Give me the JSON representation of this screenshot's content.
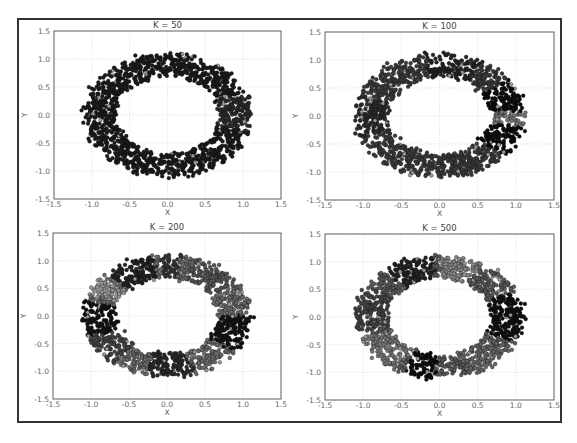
{
  "chart_data": [
    {
      "type": "scatter",
      "title": "K = 50",
      "xlabel": "X",
      "ylabel": "Y",
      "xlim": [
        -1.5,
        1.5
      ],
      "ylim": [
        -1.5,
        1.5
      ],
      "xticks": [
        "-1.5",
        "-1.0",
        "-0.5",
        "0.0",
        "0.5",
        "1.0",
        "1.5"
      ],
      "yticks": [
        "1.5",
        "1.0",
        "0.5",
        "0.0",
        "-0.5",
        "-1.0",
        "-1.5"
      ],
      "grid": true,
      "data_description": "Noisy ring of points (radius ~0.7 to ~1.1) colored by cluster; nearly all dark",
      "ring": {
        "inner_radius": 0.7,
        "outer_radius": 1.1,
        "n_points": 1400
      },
      "clusters": [
        {
          "from_deg": 0,
          "to_deg": 360,
          "gray": "#1a1a1a"
        },
        {
          "from_deg": -15,
          "to_deg": 20,
          "gray": "#2a2a2a",
          "speckle": "#888888"
        }
      ]
    },
    {
      "type": "scatter",
      "title": "K = 100",
      "xlabel": "X",
      "ylabel": "Y",
      "xlim": [
        -1.5,
        1.5
      ],
      "ylim": [
        -1.5,
        1.5
      ],
      "xticks": [
        "-1.5",
        "-1.0",
        "-0.5",
        "0.0",
        "0.5",
        "1.0",
        "1.5"
      ],
      "yticks": [
        "1.5",
        "1.0",
        "0.5",
        "0.0",
        "-0.5",
        "-1.0",
        "-1.5"
      ],
      "grid": true,
      "data_description": "Noisy ring, mostly dark gray with a black cluster on the right side",
      "ring": {
        "inner_radius": 0.7,
        "outer_radius": 1.1,
        "n_points": 1400
      },
      "clusters": [
        {
          "from_deg": 0,
          "to_deg": 360,
          "gray": "#3a3a3a"
        },
        {
          "from_deg": -40,
          "to_deg": 35,
          "gray": "#0a0a0a"
        },
        {
          "from_deg": -10,
          "to_deg": 5,
          "gray": "#777777"
        },
        {
          "from_deg": 60,
          "to_deg": 100,
          "gray": "#222222"
        },
        {
          "from_deg": 160,
          "to_deg": 200,
          "gray": "#2a2a2a"
        }
      ]
    },
    {
      "type": "scatter",
      "title": "K = 200",
      "xlabel": "X",
      "ylabel": "Y",
      "xlim": [
        -1.5,
        1.5
      ],
      "ylim": [
        -1.5,
        1.5
      ],
      "xticks": [
        "-1.5",
        "-1.0",
        "-0.5",
        "0.0",
        "0.5",
        "1.0",
        "1.5"
      ],
      "yticks": [
        "1.5",
        "1.0",
        "0.5",
        "0.0",
        "-0.5",
        "-1.0",
        "-1.5"
      ],
      "grid": true,
      "data_description": "Noisy ring with mixed gray clusters; dark clusters at left, top-left, top-center, right and bottom-center",
      "ring": {
        "inner_radius": 0.7,
        "outer_radius": 1.1,
        "n_points": 1400
      },
      "clusters": [
        {
          "from_deg": 0,
          "to_deg": 360,
          "gray": "#6a6a6a"
        },
        {
          "from_deg": 100,
          "to_deg": 135,
          "gray": "#222222"
        },
        {
          "from_deg": 80,
          "to_deg": 95,
          "gray": "#333333"
        },
        {
          "from_deg": 165,
          "to_deg": 200,
          "gray": "#111111"
        },
        {
          "from_deg": 200,
          "to_deg": 230,
          "gray": "#444444"
        },
        {
          "from_deg": -35,
          "to_deg": -5,
          "gray": "#111111"
        },
        {
          "from_deg": 255,
          "to_deg": 290,
          "gray": "#2a2a2a"
        },
        {
          "from_deg": 140,
          "to_deg": 160,
          "gray": "#999999"
        },
        {
          "from_deg": 30,
          "to_deg": 70,
          "gray": "#555555"
        }
      ]
    },
    {
      "type": "scatter",
      "title": "K = 500",
      "xlabel": "X",
      "ylabel": "Y",
      "xlim": [
        -1.5,
        1.5
      ],
      "ylim": [
        -1.5,
        1.5
      ],
      "xticks": [
        "-1.5",
        "-1.0",
        "-0.5",
        "0.0",
        "0.5",
        "1.0",
        "1.5"
      ],
      "yticks": [
        "1.5",
        "1.0",
        "0.5",
        "0.0",
        "-0.5",
        "-1.0",
        "-1.5"
      ],
      "grid": true,
      "data_description": "Noisy ring with many gray clusters; black clusters at right and bottom-left-center",
      "ring": {
        "inner_radius": 0.7,
        "outer_radius": 1.1,
        "n_points": 1400
      },
      "clusters": [
        {
          "from_deg": 0,
          "to_deg": 360,
          "gray": "#5a5a5a"
        },
        {
          "from_deg": 95,
          "to_deg": 130,
          "gray": "#222222"
        },
        {
          "from_deg": 60,
          "to_deg": 90,
          "gray": "#888888"
        },
        {
          "from_deg": -25,
          "to_deg": 25,
          "gray": "#0e0e0e"
        },
        {
          "from_deg": 245,
          "to_deg": 268,
          "gray": "#0a0a0a"
        },
        {
          "from_deg": 150,
          "to_deg": 195,
          "gray": "#444444"
        },
        {
          "from_deg": 200,
          "to_deg": 240,
          "gray": "#777777"
        },
        {
          "from_deg": 290,
          "to_deg": 330,
          "gray": "#666666"
        }
      ]
    }
  ],
  "layout": {
    "panels": [
      {
        "left": 54,
        "top": 31,
        "right": 281,
        "bottom": 199
      },
      {
        "left": 325,
        "top": 32,
        "right": 554,
        "bottom": 200
      },
      {
        "left": 53,
        "top": 233,
        "right": 281,
        "bottom": 399
      },
      {
        "left": 325,
        "top": 234,
        "right": 554,
        "bottom": 400
      }
    ]
  }
}
